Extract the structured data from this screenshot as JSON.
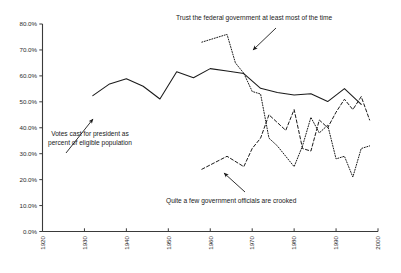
{
  "chart_data": {
    "type": "line",
    "title": "",
    "subtitle": "",
    "xlabel": "",
    "ylabel": "",
    "xlim": [
      1920,
      2000
    ],
    "ylim": [
      0,
      0.8
    ],
    "grid": false,
    "legend_position": "none",
    "x_ticks": [
      "1920",
      "1930",
      "1940",
      "1950",
      "1960",
      "1970",
      "1980",
      "1990",
      "2000"
    ],
    "x_tick_values": [
      1920,
      1930,
      1940,
      1950,
      1960,
      1970,
      1980,
      1990,
      2000
    ],
    "y_ticks": [
      "0.0%",
      "10.0%",
      "20.0%",
      "30.0%",
      "40.0%",
      "50.0%",
      "60.0%",
      "70.0%",
      "80.0%"
    ],
    "y_tick_values": [
      0,
      10,
      20,
      30,
      40,
      50,
      60,
      70,
      80
    ],
    "series": [
      {
        "name": "Votes cast for president as percent of eligible population",
        "style": "solid",
        "color": "#1a1a1a",
        "x": [
          1932,
          1936,
          1940,
          1944,
          1948,
          1952,
          1956,
          1960,
          1964,
          1968,
          1972,
          1976,
          1980,
          1984,
          1988,
          1992,
          1996
        ],
        "values": [
          52.4,
          56.9,
          58.9,
          56.0,
          51.1,
          61.6,
          59.3,
          62.8,
          61.9,
          60.9,
          55.2,
          53.6,
          52.6,
          53.1,
          50.1,
          55.1,
          49.0
        ]
      },
      {
        "name": "Trust the federal government at least most of the time",
        "style": "dotted",
        "color": "#1a1a1a",
        "x": [
          1958,
          1964,
          1966,
          1968,
          1970,
          1972,
          1974,
          1976,
          1978,
          1980,
          1982,
          1984,
          1986,
          1988,
          1990,
          1992,
          1994,
          1996,
          1998
        ],
        "values": [
          73.0,
          76.0,
          65.0,
          61.0,
          54.0,
          53.0,
          36.0,
          33.0,
          29.0,
          25.0,
          33.0,
          44.0,
          38.0,
          41.0,
          28.0,
          29.0,
          21.0,
          32.0,
          33.0
        ]
      },
      {
        "name": "Quite a few government officials are crooked",
        "style": "dashed",
        "color": "#1a1a1a",
        "x": [
          1958,
          1964,
          1968,
          1970,
          1972,
          1974,
          1976,
          1978,
          1980,
          1982,
          1984,
          1986,
          1988,
          1990,
          1992,
          1994,
          1996,
          1998
        ],
        "values": [
          24.0,
          29.0,
          25.0,
          32.0,
          36.0,
          45.0,
          42.0,
          39.0,
          47.0,
          32.0,
          31.0,
          43.0,
          40.0,
          46.0,
          51.0,
          47.0,
          52.0,
          43.0
        ]
      }
    ],
    "annotations": [
      {
        "id": "trust",
        "text": "Trust the federal government at least most of the time",
        "points_to_series": "Trust the federal government at least most of the time"
      },
      {
        "id": "votes",
        "text": "Votes cast for president as\npercent of eligible population",
        "points_to_series": "Votes cast for president as percent of eligible population"
      },
      {
        "id": "crooked",
        "text": "Quite a few government officials are crooked",
        "points_to_series": "Quite a few government officials are crooked"
      }
    ]
  },
  "axes": {
    "y_axis_label": "",
    "x_axis_label": ""
  }
}
